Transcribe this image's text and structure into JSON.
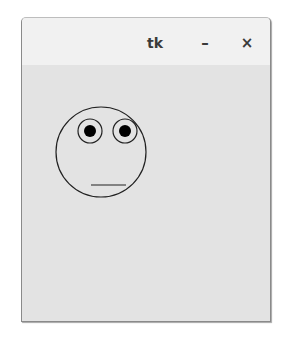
{
  "window": {
    "title": "tk",
    "minimize_label": "–",
    "close_label": "×"
  },
  "canvas": {
    "drawing": "smiley-face",
    "colors": {
      "background": "#e3e3e3",
      "stroke": "#222222",
      "pupil": "#000000"
    }
  }
}
